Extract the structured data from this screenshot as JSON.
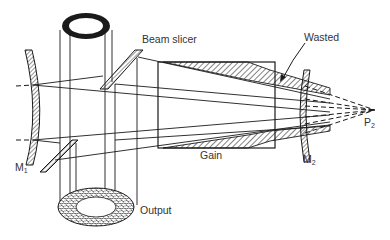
{
  "diagram": {
    "type": "optical-schematic",
    "colors": {
      "ink": "#1a1a1a",
      "label": "#333333",
      "background": "#ffffff"
    },
    "labels": {
      "beam_slicer": "Beam slicer",
      "wasted": "Wasted",
      "gain": "Gain",
      "output": "Output",
      "m1": "M",
      "m1_sub": "1",
      "m2": "M",
      "m2_sub": "2",
      "p2": "P",
      "p2_sub": "2"
    },
    "components": [
      {
        "id": "M1",
        "kind": "concave-mirror",
        "position": "left"
      },
      {
        "id": "M2",
        "kind": "convex-mirror",
        "position": "right"
      },
      {
        "id": "beam-slicer-top",
        "kind": "slanted-reflector"
      },
      {
        "id": "beam-slicer-bottom",
        "kind": "slanted-reflector"
      },
      {
        "id": "gain-medium",
        "kind": "rectangle",
        "note": "hatched wasted regions top/bottom"
      },
      {
        "id": "output-annulus-top",
        "kind": "ring",
        "note": "solid black ring"
      },
      {
        "id": "output-annulus-bottom",
        "kind": "ring",
        "note": "stippled ring"
      },
      {
        "id": "P2",
        "kind": "virtual-focal-point"
      }
    ]
  }
}
